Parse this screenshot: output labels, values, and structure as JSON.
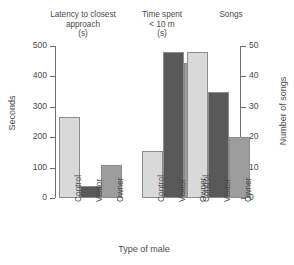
{
  "chart_data": {
    "type": "bar",
    "title": "",
    "panels": [
      {
        "title": "Latency to closest\napproach\n(s)",
        "axis": "left",
        "categories": [
          "Control",
          "Visitor",
          "Owner"
        ],
        "values": [
          265,
          40,
          108
        ]
      },
      {
        "title": "Time spent\n< 10 m\n(s)",
        "axis": "left",
        "categories": [
          "Control",
          "Visitor",
          "Owner"
        ],
        "values": [
          155,
          480,
          443
        ]
      },
      {
        "title": "Songs",
        "axis": "right",
        "categories": [
          "Control",
          "Visitor",
          "Owner"
        ],
        "values": [
          48,
          35,
          20
        ]
      }
    ],
    "categories": [
      "Control",
      "Visitor",
      "Owner"
    ],
    "series": [
      {
        "name": "Latency to closest approach (s)",
        "values": [
          265,
          40,
          108
        ]
      },
      {
        "name": "Time spent < 10 m (s)",
        "values": [
          155,
          480,
          443
        ]
      },
      {
        "name": "Songs",
        "values": [
          48,
          35,
          20
        ]
      }
    ],
    "xlabel": "Type of male",
    "ylabel": "Seconds",
    "ylabel_right": "Number of songs",
    "ylim": [
      0,
      500
    ],
    "ylim_right": [
      0,
      50
    ],
    "yticks": [
      0,
      100,
      200,
      300,
      400,
      500
    ],
    "yticks_right": [
      0,
      10,
      20,
      30,
      40,
      50
    ],
    "grid": false,
    "legend": "none",
    "bar_colors": {
      "control": "#d9d9d9",
      "visitor": "#595959",
      "owner": "#9d9d9d",
      "edge": "#8c8c8c"
    }
  },
  "axes": {
    "left": {
      "label": "Seconds",
      "ticks": [
        "500",
        "400",
        "300",
        "200",
        "100",
        "0"
      ]
    },
    "right": {
      "label": "Number of songs",
      "ticks": [
        "50",
        "40",
        "30",
        "20",
        "10",
        "0"
      ]
    },
    "x": {
      "label": "Type of male"
    }
  },
  "panels": {
    "latency": {
      "title": "Latency to closest\napproach\n(s)"
    },
    "time": {
      "title": "Time spent\n< 10 m\n(s)"
    },
    "songs": {
      "title": "Songs"
    }
  },
  "categories": {
    "control": "Control",
    "visitor": "Visitor",
    "owner": "Owner"
  }
}
